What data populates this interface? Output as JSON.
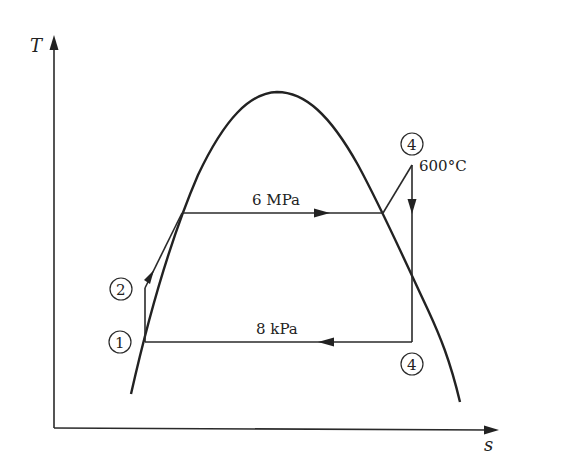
{
  "diagram": {
    "type": "T-s diagram (Rankine cycle with superheat)",
    "axes": {
      "y_label": "T",
      "x_label": "s"
    },
    "lines": {
      "high_pressure": "6 MPa",
      "low_pressure": "8 kPa"
    },
    "annotations": {
      "superheat_temperature": "600°C"
    },
    "states": [
      {
        "id": "state-1",
        "label": "1",
        "position": "pump inlet (saturated liquid at 8 kPa)"
      },
      {
        "id": "state-2",
        "label": "2",
        "position": "pump outlet"
      },
      {
        "id": "state-top",
        "label": "4",
        "position": "turbine inlet (superheated at 600°C)"
      },
      {
        "id": "state-bottom",
        "label": "4",
        "position": "turbine exit (8 kPa)"
      }
    ],
    "colors": {
      "line": "#2a2a2a",
      "background": "#ffffff"
    }
  }
}
